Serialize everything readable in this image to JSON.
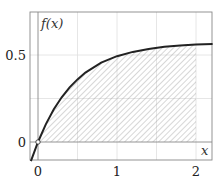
{
  "chart_data": {
    "type": "area",
    "title": "",
    "xlabel": "x",
    "ylabel": "f(x)",
    "xlim": [
      -0.09,
      2.21
    ],
    "ylim": [
      -0.103,
      0.74
    ],
    "x_ticks": [
      0,
      1,
      2
    ],
    "x_tick_labels": [
      "0",
      "1",
      "2"
    ],
    "y_ticks": [
      0,
      0.5
    ],
    "y_tick_labels": [
      "0",
      "0.5"
    ],
    "grid": true,
    "grid_x": [
      0.5,
      1,
      1.5,
      2
    ],
    "grid_y": [
      0.25,
      0.5
    ],
    "series": [
      {
        "name": "f(x)",
        "style": "solid curve",
        "color": "#222222",
        "x": [
          -0.09,
          0,
          0.1,
          0.2,
          0.3,
          0.4,
          0.5,
          0.6,
          0.8,
          1.0,
          1.2,
          1.4,
          1.6,
          1.8,
          2.0,
          2.21
        ],
        "y": [
          -0.11,
          0,
          0.103,
          0.188,
          0.257,
          0.314,
          0.36,
          0.399,
          0.456,
          0.493,
          0.518,
          0.535,
          0.547,
          0.555,
          0.56,
          0.563
        ]
      }
    ],
    "shaded_region": {
      "description": "hatched area under f(x) from x=0 to x=2",
      "x_from": 0,
      "x_to": 2,
      "pattern": "diagonal hatch"
    },
    "annotations": [
      {
        "type": "open-circle",
        "x": 0,
        "y": 0
      }
    ]
  },
  "labels": {
    "y_axis": "f(x)",
    "x_axis": "x",
    "x_tick_0": "0",
    "x_tick_1": "1",
    "x_tick_2": "2",
    "y_tick_0": "0",
    "y_tick_05": "0.5"
  },
  "colors": {
    "curve": "#222222",
    "frame": "#888888",
    "grid": "#dddddd",
    "hatch": "#999999"
  }
}
